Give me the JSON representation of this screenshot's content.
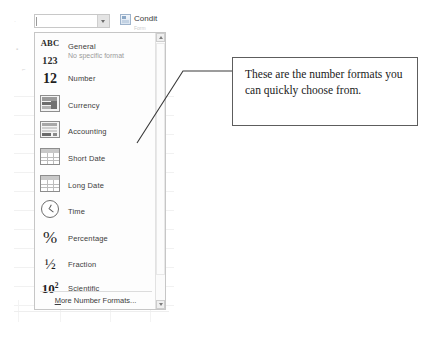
{
  "toolbar": {
    "format_combo": {
      "value": "",
      "placeholder": "",
      "arrow_icon": "chevron-down-icon"
    },
    "conditional_formatting": {
      "label": "Condit",
      "sub_label": "Form",
      "icon": "conditional-formatting-icon"
    }
  },
  "dropdown": {
    "items": [
      {
        "icon": "abc-123-icon",
        "label": "General",
        "sub": "No specific format"
      },
      {
        "icon": "number-12-icon",
        "label": "Number",
        "sub": ""
      },
      {
        "icon": "currency-icon",
        "label": "Currency",
        "sub": ""
      },
      {
        "icon": "accounting-icon",
        "label": "Accounting",
        "sub": ""
      },
      {
        "icon": "short-date-icon",
        "label": "Short Date",
        "sub": ""
      },
      {
        "icon": "long-date-icon",
        "label": "Long Date",
        "sub": ""
      },
      {
        "icon": "time-clock-icon",
        "label": "Time",
        "sub": ""
      },
      {
        "icon": "percent-icon",
        "label": "Percentage",
        "sub": ""
      },
      {
        "icon": "fraction-icon",
        "label": "Fraction",
        "sub": ""
      },
      {
        "icon": "scientific-icon",
        "label": "Scientific",
        "sub": ""
      }
    ],
    "icon_glyphs": {
      "abc_line1": "ABC",
      "abc_line2": "123",
      "number": "12",
      "percent": "%",
      "fraction": "½",
      "scientific_base": "10",
      "scientific_exp": "2"
    },
    "more_formats": {
      "accelerator": "M",
      "rest": "ore Number Formats..."
    },
    "scrollbar": {
      "up_icon": "scroll-up-arrow-icon",
      "down_icon": "scroll-down-arrow-icon"
    }
  },
  "callout": {
    "text": "These are the number formats you can quickly choose from."
  },
  "colors": {
    "panel_border": "#c6c6c6",
    "callout_border": "#5d5d5d",
    "label_text": "#3c3c3c",
    "sub_text": "#9b9b9b",
    "leader_line": "#3a3a3a"
  }
}
